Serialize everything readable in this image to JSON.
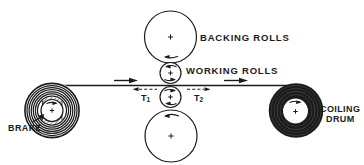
{
  "diagram": {
    "kind": "rolling-mill-schematic",
    "colors": {
      "ink": "#1b1b1b",
      "background": "#ffffff"
    },
    "labels": {
      "backing_rolls": "BACKING ROLLS",
      "working_rolls": "WORKING ROLLS",
      "brake": "BRAKE",
      "coiling_line1": "COILING",
      "coiling_line2": "DRUM",
      "t1": {
        "base": "T",
        "sub": "1"
      },
      "t2": {
        "base": "T",
        "sub": "2"
      }
    },
    "components": [
      "backing-roll-top",
      "working-roll-top",
      "working-roll-bottom",
      "backing-roll-bottom",
      "uncoiler-with-brake",
      "coiling-drum",
      "strip"
    ],
    "strip_direction": "right"
  }
}
